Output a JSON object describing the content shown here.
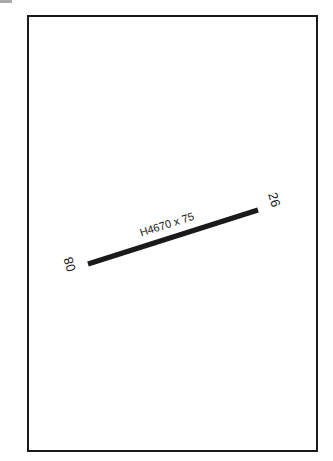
{
  "diagram": {
    "type": "airport-runway-diagram",
    "runway": {
      "designation_start": "08",
      "designation_end": "26",
      "label": "H4670 x 75",
      "start": [
        88,
        264
      ],
      "end": [
        258,
        210
      ]
    },
    "colors": {
      "line": "#1a1a1a",
      "background": "#ffffff"
    }
  }
}
